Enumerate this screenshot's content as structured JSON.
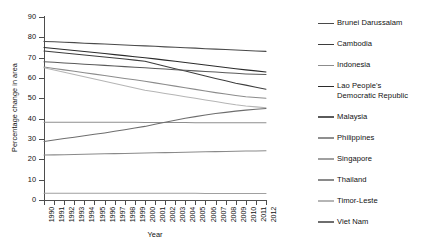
{
  "chart_data": {
    "type": "line",
    "title": "",
    "xlabel": "Year",
    "ylabel": "Percentage change in area",
    "ylim": [
      0,
      90
    ],
    "yticks": [
      0,
      10,
      20,
      30,
      40,
      50,
      60,
      70,
      80,
      90
    ],
    "grid": false,
    "legend_position": "right",
    "x": [
      1990,
      1991,
      1992,
      1993,
      1994,
      1995,
      1996,
      1997,
      1998,
      1999,
      2000,
      2001,
      2002,
      2003,
      2004,
      2005,
      2006,
      2007,
      2008,
      2009,
      2010,
      2011,
      2012
    ],
    "categories": [
      "1990",
      "1991",
      "1992",
      "1993",
      "1994",
      "1995",
      "1996",
      "1997",
      "1998",
      "1999",
      "2000",
      "2001",
      "2002",
      "2003",
      "2004",
      "2005",
      "2006",
      "2007",
      "2008",
      "2009",
      "2010",
      "2011",
      "2012"
    ],
    "series": [
      {
        "name": "Brunei Darussalam",
        "color": "#4a4a4a",
        "values": [
          78.0,
          77.8,
          77.6,
          77.4,
          77.1,
          76.9,
          76.7,
          76.5,
          76.2,
          76.0,
          75.8,
          75.6,
          75.3,
          75.1,
          74.9,
          74.7,
          74.4,
          74.2,
          74.0,
          73.8,
          73.5,
          73.3,
          73.1
        ]
      },
      {
        "name": "Cambodia",
        "color": "#3d3d3d",
        "values": [
          73.3,
          72.8,
          72.3,
          71.8,
          71.3,
          70.8,
          70.3,
          69.8,
          69.3,
          68.8,
          68.2,
          67.0,
          65.8,
          64.6,
          63.4,
          62.2,
          61.0,
          59.8,
          58.6,
          57.4,
          56.5,
          55.5,
          54.5
        ]
      },
      {
        "name": "Indonesia",
        "color": "#8c8c8c",
        "values": [
          65.4,
          64.7,
          64.0,
          63.3,
          62.6,
          61.9,
          61.2,
          60.5,
          59.8,
          59.1,
          58.4,
          57.6,
          56.8,
          56.0,
          55.2,
          54.4,
          53.6,
          52.8,
          52.1,
          51.4,
          50.8,
          50.4,
          50.0
        ]
      },
      {
        "name": "Lao People's\nDemocratic Republic",
        "color": "#2b2b2b",
        "values": [
          75.0,
          74.5,
          74.0,
          73.5,
          73.0,
          72.5,
          72.0,
          71.5,
          71.0,
          70.5,
          70.0,
          69.4,
          68.8,
          68.2,
          67.6,
          67.0,
          66.4,
          65.8,
          65.2,
          64.6,
          64.0,
          63.5,
          63.0
        ]
      },
      {
        "name": "Malaysia",
        "color": "#5a5a5a",
        "values": [
          68.0,
          67.7,
          67.4,
          67.1,
          66.8,
          66.5,
          66.2,
          65.9,
          65.6,
          65.3,
          65.0,
          64.7,
          64.4,
          64.1,
          63.8,
          63.5,
          63.2,
          62.9,
          62.6,
          62.3,
          62.0,
          61.8,
          61.7
        ]
      },
      {
        "name": "Philippines",
        "color": "#8f8f8f",
        "values": [
          38.2,
          38.2,
          38.2,
          38.2,
          38.2,
          38.2,
          38.2,
          38.2,
          38.2,
          38.2,
          38.1,
          38.1,
          38.1,
          38.1,
          38.1,
          38.0,
          38.0,
          38.0,
          38.0,
          38.0,
          38.0,
          38.0,
          38.0
        ]
      },
      {
        "name": "Singapore",
        "color": "#a0a0a0",
        "values": [
          3.3,
          3.3,
          3.3,
          3.3,
          3.3,
          3.3,
          3.3,
          3.3,
          3.3,
          3.3,
          3.3,
          3.3,
          3.3,
          3.3,
          3.3,
          3.3,
          3.2,
          3.2,
          3.2,
          3.2,
          3.2,
          3.2,
          3.2
        ]
      },
      {
        "name": "Thailand",
        "color": "#8a8a8a",
        "values": [
          22.1,
          22.2,
          22.3,
          22.4,
          22.5,
          22.6,
          22.7,
          22.8,
          22.9,
          23.0,
          23.1,
          23.2,
          23.3,
          23.4,
          23.5,
          23.6,
          23.7,
          23.8,
          23.9,
          24.0,
          24.1,
          24.1,
          24.2
        ]
      },
      {
        "name": "Timor-Leste",
        "color": "#b5b5b5",
        "values": [
          65.0,
          63.9,
          62.8,
          61.7,
          60.6,
          59.5,
          58.4,
          57.3,
          56.2,
          55.1,
          54.0,
          53.2,
          52.4,
          51.6,
          50.8,
          50.0,
          49.2,
          48.4,
          47.6,
          46.8,
          46.2,
          45.8,
          45.4
        ]
      },
      {
        "name": "Viet Nam",
        "color": "#6e6e6e",
        "values": [
          28.8,
          29.5,
          30.2,
          30.9,
          31.6,
          32.3,
          33.0,
          33.8,
          34.6,
          35.4,
          36.2,
          37.2,
          38.2,
          39.2,
          40.2,
          41.0,
          41.8,
          42.5,
          43.1,
          43.7,
          44.2,
          44.6,
          45.0
        ]
      }
    ]
  },
  "legend": {
    "items": [
      {
        "label": "Brunei Darussalam"
      },
      {
        "label": "Cambodia"
      },
      {
        "label": "Indonesia"
      },
      {
        "label": "Lao People's\nDemocratic Republic"
      },
      {
        "label": "Malaysia"
      },
      {
        "label": "Philippines"
      },
      {
        "label": "Singapore"
      },
      {
        "label": "Thailand"
      },
      {
        "label": "Timor-Leste"
      },
      {
        "label": "Viet Nam"
      }
    ]
  }
}
